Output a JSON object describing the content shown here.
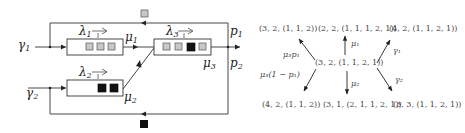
{
  "network": {
    "inputs": [
      {
        "id": "gamma1",
        "label": "γ",
        "sub": "1"
      },
      {
        "id": "gamma2",
        "label": "γ",
        "sub": "2"
      }
    ],
    "queues": [
      {
        "id": "q1",
        "rate_label": "λ",
        "rate_sub": "1",
        "service_label": "μ",
        "service_sub": "1",
        "jobs": [
          "gray",
          "gray",
          "gray"
        ]
      },
      {
        "id": "q2",
        "rate_label": "λ",
        "rate_sub": "2",
        "service_label": "μ",
        "service_sub": "2",
        "jobs": [
          "black",
          "black"
        ]
      },
      {
        "id": "q3",
        "rate_label": "λ",
        "rate_sub": "3",
        "service_label": "μ",
        "service_sub": "3",
        "jobs": [
          "gray",
          "gray",
          "black",
          "gray"
        ]
      }
    ],
    "routing": [
      {
        "id": "p1",
        "label": "p",
        "sub": "1"
      },
      {
        "id": "p2",
        "label": "p",
        "sub": "2"
      }
    ],
    "feedback_tokens": {
      "top": "gray",
      "bottom": "black"
    },
    "colors": {
      "gray_job": "#c8c8c8",
      "black_job": "#111111",
      "line": "#333333"
    }
  },
  "transitions": {
    "center": "(3, 2, (1, 1, 2, 1))",
    "targets": [
      {
        "id": "up-left",
        "state": "(3, 2, (1, 1, 2))",
        "rate": "μ₃p₁"
      },
      {
        "id": "up",
        "state": "(2, 2, (1, 1, 1, 2, 1))",
        "rate": "μ₁"
      },
      {
        "id": "up-right",
        "state": "(4, 2, (1, 1, 2, 1))",
        "rate": "γ₁"
      },
      {
        "id": "down-left",
        "state": "(4, 2, (1, 1, 2))",
        "rate": "μ₃(1 − p₁)"
      },
      {
        "id": "down",
        "state": "(3, 1, (2, 1, 1, 2, 1))",
        "rate": "μ₂"
      },
      {
        "id": "down-right",
        "state": "(3, 3, (1, 1, 2, 1))",
        "rate": "γ₂"
      }
    ]
  }
}
